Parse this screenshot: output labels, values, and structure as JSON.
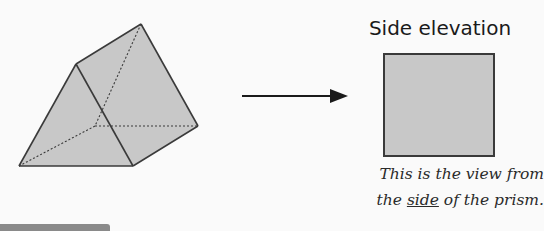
{
  "diagram": {
    "shape": "triangular prism",
    "title": "Side elevation",
    "caption": {
      "line1": "This is the view from",
      "line2_before": "the ",
      "line2_emphasis": "side",
      "line2_after": " of the prism."
    },
    "colors": {
      "face_fill": "#c8c8c8",
      "edge": "#3a3a3a",
      "background": "#fafafa"
    },
    "prism_vertices": {
      "front_apex": [
        76,
        64
      ],
      "back_apex": [
        141,
        24
      ],
      "front_bottom_left": [
        19,
        166
      ],
      "front_bottom_right": [
        133,
        166
      ],
      "back_bottom_right": [
        198,
        126
      ],
      "back_bottom_left_hidden": [
        95,
        126
      ]
    }
  }
}
